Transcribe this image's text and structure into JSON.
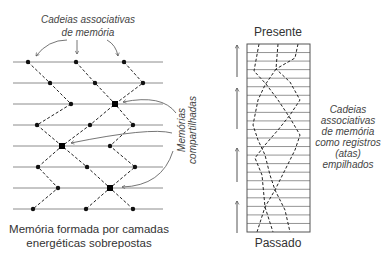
{
  "left_panel": {
    "top_label": {
      "line1": "Cadeias associativas",
      "line2": "de memória"
    },
    "side_label": {
      "line1": "Memórias",
      "line2": "compartilhadas"
    },
    "caption": {
      "line1": "Memória formada por camadas",
      "line2": "energéticas sobrepostas"
    },
    "layers": {
      "x1": 13,
      "x2": 163,
      "y": [
        62,
        83,
        104,
        125,
        146,
        167,
        188,
        209
      ]
    },
    "chains": [
      [
        [
          28,
          62
        ],
        [
          50,
          83
        ],
        [
          71,
          104
        ],
        [
          37,
          125
        ],
        [
          62,
          146
        ],
        [
          87,
          167
        ],
        [
          110,
          188
        ],
        [
          133,
          209
        ]
      ],
      [
        [
          76,
          62
        ],
        [
          95,
          83
        ],
        [
          115,
          104
        ],
        [
          133,
          125
        ],
        [
          110,
          146
        ],
        [
          135,
          167
        ],
        [
          110,
          188
        ],
        [
          86,
          209
        ]
      ],
      [
        [
          124,
          62
        ],
        [
          143,
          83
        ],
        [
          115,
          104
        ],
        [
          90,
          125
        ],
        [
          62,
          146
        ],
        [
          38,
          167
        ],
        [
          58,
          188
        ],
        [
          33,
          209
        ]
      ]
    ],
    "nodes": [
      [
        28,
        62
      ],
      [
        76,
        62
      ],
      [
        124,
        62
      ],
      [
        50,
        83
      ],
      [
        95,
        83
      ],
      [
        143,
        83
      ],
      [
        71,
        104
      ],
      [
        37,
        125
      ],
      [
        90,
        125
      ],
      [
        133,
        125
      ],
      [
        110,
        146
      ],
      [
        38,
        167
      ],
      [
        87,
        167
      ],
      [
        135,
        167
      ],
      [
        58,
        188
      ],
      [
        33,
        209
      ],
      [
        86,
        209
      ],
      [
        133,
        209
      ]
    ],
    "shared_nodes": [
      [
        115,
        104
      ],
      [
        62,
        146
      ],
      [
        110,
        188
      ]
    ],
    "top_pointers": [
      "M67,40 Q48,40 36,56",
      "M77,40 L77,54",
      "M107,40 Q116,45 118,56"
    ],
    "shared_pointers": [
      "M176,113 Q162,94 123,102",
      "M172,133 Q150,127 71,143",
      "M173,151 Q162,186 122,187"
    ]
  },
  "right_panel": {
    "top_label": "Presente",
    "bottom_label": "Passado",
    "side_label": [
      "Cadeias",
      "associativas",
      "de memória",
      "como registros",
      "(atas)",
      "empilhados"
    ],
    "box": {
      "x": 247,
      "y": 44,
      "w": 63,
      "h": 188,
      "rows": 22
    },
    "chains": [
      [
        [
          259,
          44
        ],
        [
          254,
          71
        ],
        [
          266,
          84
        ],
        [
          278,
          100
        ],
        [
          290,
          118
        ],
        [
          300,
          135
        ],
        [
          295,
          150
        ],
        [
          285,
          170
        ],
        [
          275,
          190
        ],
        [
          265,
          207
        ],
        [
          257,
          232
        ]
      ],
      [
        [
          278,
          44
        ],
        [
          276,
          69
        ],
        [
          265,
          85
        ],
        [
          258,
          100
        ],
        [
          253,
          125
        ],
        [
          258,
          140
        ],
        [
          265,
          155
        ],
        [
          270,
          175
        ],
        [
          275,
          190
        ],
        [
          285,
          210
        ],
        [
          290,
          232
        ]
      ],
      [
        [
          298,
          44
        ],
        [
          295,
          58
        ],
        [
          276,
          69
        ],
        [
          290,
          82
        ],
        [
          300,
          100
        ],
        [
          290,
          115
        ],
        [
          278,
          130
        ],
        [
          265,
          145
        ],
        [
          255,
          158
        ],
        [
          262,
          175
        ],
        [
          265,
          207
        ],
        [
          273,
          232
        ]
      ]
    ],
    "time_arrows": {
      "x": 237,
      "spans": [
        [
          44,
          77
        ],
        [
          87,
          129
        ],
        [
          147,
          182
        ],
        [
          200,
          233
        ]
      ]
    }
  }
}
